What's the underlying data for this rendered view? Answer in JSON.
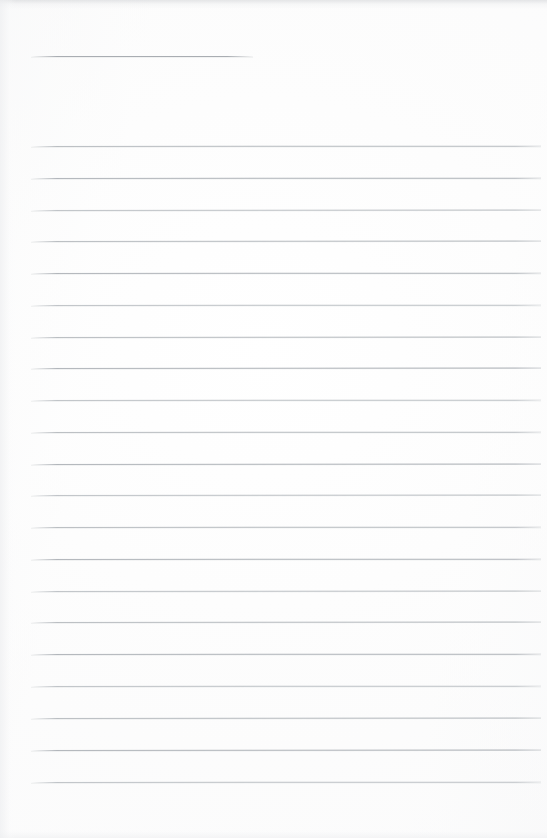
{
  "document": {
    "kind": "scanned-ruled-notebook-page",
    "page_width": 547,
    "page_height": 838,
    "background_color": "#fdfdfd",
    "rule_color": "#b9bdc1",
    "header_rule_color": "#a9adb2",
    "body_text": "",
    "handwriting": "",
    "page_number": "",
    "header_text": ""
  },
  "header_rule": {
    "name": "title-rule",
    "x": 31,
    "y": 56,
    "width": 222
  },
  "ruled_lines": {
    "left": 31,
    "right": 541,
    "width": 510,
    "first_y": 146,
    "spacing": 31.8,
    "count": 21,
    "y_positions": [
      146,
      178,
      210,
      241,
      273,
      305,
      337,
      368,
      400,
      432,
      464,
      495,
      527,
      559,
      591,
      622,
      654,
      686,
      718,
      750,
      782
    ]
  }
}
